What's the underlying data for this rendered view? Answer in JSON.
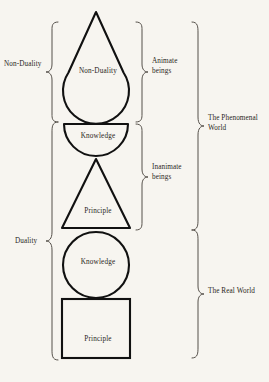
{
  "figure": {
    "background_color": "#f7f5f0",
    "stroke_color": "#111111",
    "brace_color": "#55504a",
    "text_color": "#2a2622"
  },
  "shapes": [
    {
      "id": "teardrop",
      "name": "teardrop-shape",
      "label": "Non-Duality",
      "geometry": "triangle apex on top merging into circular lower half"
    },
    {
      "id": "bowl",
      "name": "half-disc-shape",
      "label": "Knowledge",
      "geometry": "semicircle with flat top edge and curved bottom"
    },
    {
      "id": "triangle",
      "name": "triangle-shape",
      "label": "Principle",
      "geometry": "upward pointing triangle"
    },
    {
      "id": "circle",
      "name": "circle-shape",
      "label": "Knowledge",
      "geometry": "full circle"
    },
    {
      "id": "square",
      "name": "square-shape",
      "label": "Principle",
      "geometry": "square"
    }
  ],
  "braces": {
    "left": [
      {
        "id": "non-duality",
        "label": "Non-Duality",
        "side": "left",
        "spans": [
          "teardrop"
        ]
      },
      {
        "id": "duality",
        "label": "Duality",
        "side": "left",
        "spans": [
          "bowl",
          "triangle",
          "circle",
          "square"
        ]
      }
    ],
    "inner_right": [
      {
        "id": "animate",
        "label": "Animate\nbeings",
        "side": "right",
        "spans": [
          "teardrop"
        ]
      },
      {
        "id": "inanimate",
        "label": "Inanimate\nbeings",
        "side": "right",
        "spans": [
          "bowl",
          "triangle"
        ]
      }
    ],
    "outer_right": [
      {
        "id": "phenomenal",
        "label": "The Phenomenal\nWorld",
        "side": "right",
        "spans": [
          "teardrop",
          "bowl",
          "triangle"
        ]
      },
      {
        "id": "real",
        "label": "The Real World",
        "side": "right",
        "spans": [
          "circle",
          "square"
        ]
      }
    ]
  }
}
